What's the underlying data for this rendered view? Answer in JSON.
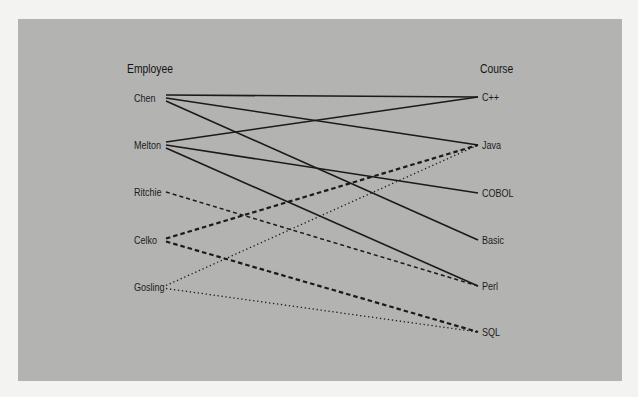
{
  "diagram": {
    "type": "bipartite-association",
    "left_header": "Employee",
    "right_header": "Course",
    "employees": [
      {
        "name": "Chen",
        "y": 98
      },
      {
        "name": "Melton",
        "y": 145
      },
      {
        "name": "Ritchie",
        "y": 192
      },
      {
        "name": "Celko",
        "y": 240
      },
      {
        "name": "Gosling",
        "y": 287
      }
    ],
    "courses": [
      {
        "name": "C++",
        "y": 97
      },
      {
        "name": "Java",
        "y": 145
      },
      {
        "name": "COBOL",
        "y": 193
      },
      {
        "name": "Basic",
        "y": 240
      },
      {
        "name": "Perl",
        "y": 286
      },
      {
        "name": "SQL",
        "y": 332
      }
    ],
    "links": [
      {
        "from": "Chen",
        "to": "C++",
        "style": "solid"
      },
      {
        "from": "Chen",
        "to": "Java",
        "style": "solid"
      },
      {
        "from": "Chen",
        "to": "Basic",
        "style": "solid"
      },
      {
        "from": "Melton",
        "to": "C++",
        "style": "solid"
      },
      {
        "from": "Melton",
        "to": "COBOL",
        "style": "solid"
      },
      {
        "from": "Melton",
        "to": "Perl",
        "style": "solid"
      },
      {
        "from": "Ritchie",
        "to": "Perl",
        "style": "dashed"
      },
      {
        "from": "Celko",
        "to": "Java",
        "style": "dashed-bold"
      },
      {
        "from": "Celko",
        "to": "SQL",
        "style": "dashed-bold"
      },
      {
        "from": "Gosling",
        "to": "Java",
        "style": "dotted"
      },
      {
        "from": "Gosling",
        "to": "SQL",
        "style": "dotted"
      }
    ]
  },
  "colors": {
    "page_background": "#f3f3f2",
    "panel_background": "#b3b3b2",
    "line": "#1a1a1a",
    "text": "#1c1c1c"
  }
}
